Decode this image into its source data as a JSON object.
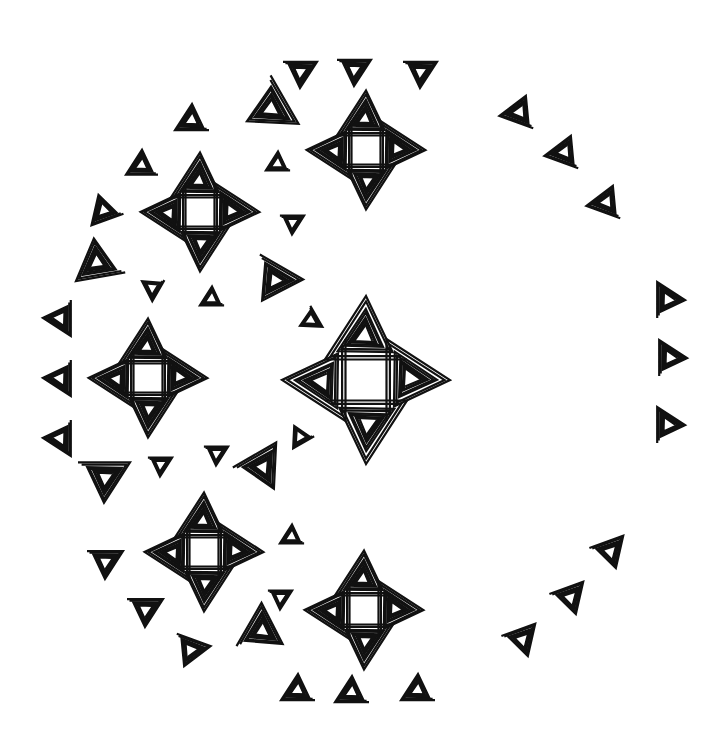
{
  "artwork": {
    "type": "line-art coloring pattern",
    "motif": "spiral triangles",
    "stroke_color": "#111111",
    "background_color": "#ffffff",
    "shapes": [
      {
        "kind": "small",
        "x": 300,
        "y": 72,
        "s": 34,
        "r": 0
      },
      {
        "kind": "small",
        "x": 354,
        "y": 70,
        "s": 34,
        "r": 0
      },
      {
        "kind": "small",
        "x": 420,
        "y": 72,
        "s": 34,
        "r": 0
      },
      {
        "kind": "small",
        "x": 192,
        "y": 120,
        "s": 34,
        "r": 180
      },
      {
        "kind": "small",
        "x": 520,
        "y": 112,
        "s": 36,
        "r": 200
      },
      {
        "kind": "small",
        "x": 565,
        "y": 152,
        "s": 36,
        "r": 200
      },
      {
        "kind": "small",
        "x": 607,
        "y": 202,
        "s": 36,
        "r": 200
      },
      {
        "kind": "small",
        "x": 142,
        "y": 165,
        "s": 32,
        "r": 180
      },
      {
        "kind": "small",
        "x": 104,
        "y": 210,
        "s": 34,
        "r": 160
      },
      {
        "kind": "small",
        "x": 60,
        "y": 318,
        "s": 36,
        "r": 90
      },
      {
        "kind": "small",
        "x": 60,
        "y": 378,
        "s": 36,
        "r": 90
      },
      {
        "kind": "small",
        "x": 60,
        "y": 438,
        "s": 36,
        "r": 90
      },
      {
        "kind": "small",
        "x": 668,
        "y": 300,
        "s": 36,
        "r": 270
      },
      {
        "kind": "small",
        "x": 670,
        "y": 358,
        "s": 36,
        "r": 270
      },
      {
        "kind": "small",
        "x": 668,
        "y": 425,
        "s": 36,
        "r": 270
      },
      {
        "kind": "small",
        "x": 610,
        "y": 552,
        "s": 36,
        "r": 340
      },
      {
        "kind": "small",
        "x": 570,
        "y": 598,
        "s": 36,
        "r": 340
      },
      {
        "kind": "small",
        "x": 522,
        "y": 640,
        "s": 36,
        "r": 340
      },
      {
        "kind": "small",
        "x": 298,
        "y": 690,
        "s": 34,
        "r": 180
      },
      {
        "kind": "small",
        "x": 352,
        "y": 692,
        "s": 34,
        "r": 180
      },
      {
        "kind": "small",
        "x": 418,
        "y": 690,
        "s": 34,
        "r": 180
      },
      {
        "kind": "small",
        "x": 105,
        "y": 562,
        "s": 36,
        "r": 0
      },
      {
        "kind": "small",
        "x": 145,
        "y": 610,
        "s": 36,
        "r": 0
      },
      {
        "kind": "small",
        "x": 190,
        "y": 650,
        "s": 36,
        "r": 20
      },
      {
        "kind": "small",
        "x": 98,
        "y": 262,
        "s": 50,
        "r": 170
      },
      {
        "kind": "small",
        "x": 270,
        "y": 108,
        "s": 56,
        "r": 60
      },
      {
        "kind": "small",
        "x": 274,
        "y": 280,
        "s": 50,
        "r": 30
      },
      {
        "kind": "small",
        "x": 104,
        "y": 478,
        "s": 52,
        "r": 0
      },
      {
        "kind": "small",
        "x": 262,
        "y": 468,
        "s": 50,
        "r": 330
      },
      {
        "kind": "small",
        "x": 262,
        "y": 632,
        "s": 50,
        "r": 300
      },
      {
        "kind": "tiny",
        "x": 278,
        "y": 163,
        "s": 22,
        "r": 180
      },
      {
        "kind": "tiny",
        "x": 292,
        "y": 223,
        "s": 22,
        "r": 0
      },
      {
        "kind": "tiny",
        "x": 152,
        "y": 287,
        "s": 22,
        "r": 120
      },
      {
        "kind": "tiny",
        "x": 212,
        "y": 298,
        "s": 22,
        "r": 180
      },
      {
        "kind": "tiny",
        "x": 310,
        "y": 320,
        "s": 22,
        "r": 60
      },
      {
        "kind": "tiny",
        "x": 300,
        "y": 436,
        "s": 22,
        "r": 150
      },
      {
        "kind": "tiny",
        "x": 160,
        "y": 465,
        "s": 22,
        "r": 0
      },
      {
        "kind": "tiny",
        "x": 216,
        "y": 454,
        "s": 22,
        "r": 0
      },
      {
        "kind": "tiny",
        "x": 292,
        "y": 536,
        "s": 22,
        "r": 180
      },
      {
        "kind": "tiny",
        "x": 280,
        "y": 598,
        "s": 22,
        "r": 0
      }
    ],
    "bowties": [
      {
        "x": 366,
        "y": 150,
        "s": 58,
        "r": 90
      },
      {
        "x": 200,
        "y": 212,
        "s": 60,
        "r": 0
      },
      {
        "x": 366,
        "y": 258,
        "s": 46,
        "r": 0
      },
      {
        "x": 148,
        "y": 378,
        "s": 58,
        "r": 0
      },
      {
        "x": 238,
        "y": 382,
        "s": 46,
        "r": 90
      },
      {
        "x": 366,
        "y": 490,
        "s": 50,
        "r": 0
      },
      {
        "x": 204,
        "y": 552,
        "s": 60,
        "r": 0
      },
      {
        "x": 364,
        "y": 610,
        "s": 60,
        "r": 90
      }
    ],
    "crosses": [
      {
        "x": 366,
        "y": 150,
        "s": 58
      },
      {
        "x": 200,
        "y": 212,
        "s": 58
      },
      {
        "x": 148,
        "y": 378,
        "s": 58
      },
      {
        "x": 366,
        "y": 380,
        "s": 82
      },
      {
        "x": 204,
        "y": 552,
        "s": 58
      },
      {
        "x": 364,
        "y": 610,
        "s": 58
      }
    ]
  }
}
